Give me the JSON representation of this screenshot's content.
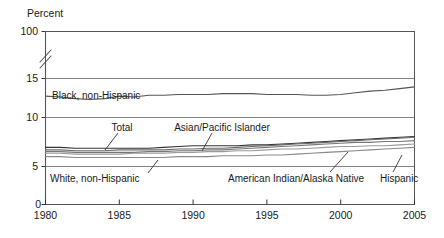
{
  "chart_data": {
    "type": "line",
    "title": "",
    "subtitle": "",
    "xlabel": "",
    "ylabel": "Percent",
    "ylim": [
      0,
      100
    ],
    "grid": true,
    "legend_position": "inline-annotations",
    "axis_break": {
      "present": true,
      "between": [
        15,
        100
      ],
      "symbol": "double-slash"
    },
    "y_ticks": [
      "0",
      "5",
      "10",
      "15",
      "100"
    ],
    "y_tick_values": [
      0,
      5,
      10,
      15,
      100
    ],
    "x_ticks": [
      "1980",
      "1985",
      "1990",
      "1995",
      "2000",
      "2005"
    ],
    "x_tick_values": [
      1980,
      1985,
      1990,
      1995,
      2000,
      2005
    ],
    "x": [
      1980,
      1981,
      1982,
      1983,
      1984,
      1985,
      1986,
      1987,
      1988,
      1989,
      1990,
      1991,
      1992,
      1993,
      1994,
      1995,
      1996,
      1997,
      1998,
      1999,
      2000,
      2001,
      2002,
      2003,
      2004,
      2005
    ],
    "series": [
      {
        "name": "Black, non-Hispanic",
        "color": "#555555",
        "values": [
          12.9,
          12.8,
          12.6,
          12.5,
          12.6,
          12.9,
          12.8,
          13.0,
          13.0,
          13.1,
          13.1,
          13.1,
          13.2,
          13.2,
          13.2,
          13.1,
          13.1,
          13.1,
          13.0,
          13.0,
          13.1,
          13.3,
          13.5,
          13.6,
          13.8,
          14.0
        ]
      },
      {
        "name": "Total",
        "color": "#333333",
        "values": [
          6.8,
          6.8,
          6.7,
          6.7,
          6.7,
          6.7,
          6.7,
          6.7,
          6.8,
          6.9,
          7.0,
          7.0,
          7.0,
          7.0,
          7.1,
          7.1,
          7.2,
          7.3,
          7.4,
          7.5,
          7.6,
          7.7,
          7.8,
          7.9,
          8.0,
          8.1
        ]
      },
      {
        "name": "White, non-Hispanic",
        "color": "#8a8a8a",
        "values": [
          5.7,
          5.7,
          5.6,
          5.6,
          5.6,
          5.6,
          5.6,
          5.6,
          5.6,
          5.7,
          5.7,
          5.7,
          5.8,
          5.8,
          5.8,
          5.9,
          5.9,
          6.0,
          6.1,
          6.2,
          6.3,
          6.4,
          6.5,
          6.6,
          6.7,
          6.8
        ]
      },
      {
        "name": "Asian/Pacific Islander",
        "color": "#6b6b6b",
        "values": [
          6.5,
          6.5,
          6.4,
          6.4,
          6.4,
          6.5,
          6.5,
          6.5,
          6.5,
          6.6,
          6.6,
          6.7,
          6.7,
          6.8,
          6.9,
          7.0,
          7.1,
          7.2,
          7.3,
          7.4,
          7.5,
          7.6,
          7.7,
          7.8,
          7.9,
          8.0
        ]
      },
      {
        "name": "American Indian/Alaska Native",
        "color": "#777777",
        "values": [
          6.3,
          6.3,
          6.2,
          6.2,
          6.2,
          6.2,
          6.2,
          6.3,
          6.3,
          6.4,
          6.4,
          6.5,
          6.5,
          6.6,
          6.7,
          6.8,
          6.9,
          7.0,
          7.1,
          7.2,
          7.3,
          7.4,
          7.4,
          7.5,
          7.5,
          7.6
        ]
      },
      {
        "name": "Hispanic",
        "color": "#9a9a9a",
        "values": [
          6.1,
          6.1,
          6.0,
          6.0,
          6.0,
          6.0,
          6.1,
          6.1,
          6.1,
          6.2,
          6.2,
          6.3,
          6.3,
          6.4,
          6.4,
          6.5,
          6.6,
          6.6,
          6.7,
          6.8,
          6.9,
          6.9,
          7.0,
          7.0,
          7.1,
          7.2
        ]
      }
    ],
    "annotations": [
      {
        "text": "Black, non-Hispanic",
        "target_series": "Black, non-Hispanic"
      },
      {
        "text": "Total",
        "target_series": "Total"
      },
      {
        "text": "Asian/Pacific Islander",
        "target_series": "Asian/Pacific Islander"
      },
      {
        "text": "White, non-Hispanic",
        "target_series": "White, non-Hispanic"
      },
      {
        "text": "American Indian/Alaska Native",
        "target_series": "American Indian/Alaska Native"
      },
      {
        "text": "Hispanic",
        "target_series": "Hispanic"
      }
    ]
  },
  "axis": {
    "y_title": "Percent",
    "y_tick_100": "100",
    "y_tick_15": "15",
    "y_tick_10": "10",
    "y_tick_5": "5",
    "y_tick_0": "0",
    "x_tick_1980": "1980",
    "x_tick_1985": "1985",
    "x_tick_1990": "1990",
    "x_tick_1995": "1995",
    "x_tick_2000": "2000",
    "x_tick_2005": "2005"
  },
  "labels": {
    "black_non_hispanic": "Black, non-Hispanic",
    "total": "Total",
    "asian_pacific_islander": "Asian/Pacific Islander",
    "white_non_hispanic": "White, non-Hispanic",
    "american_indian_alaska_native": "American Indian/Alaska Native",
    "hispanic": "Hispanic"
  }
}
